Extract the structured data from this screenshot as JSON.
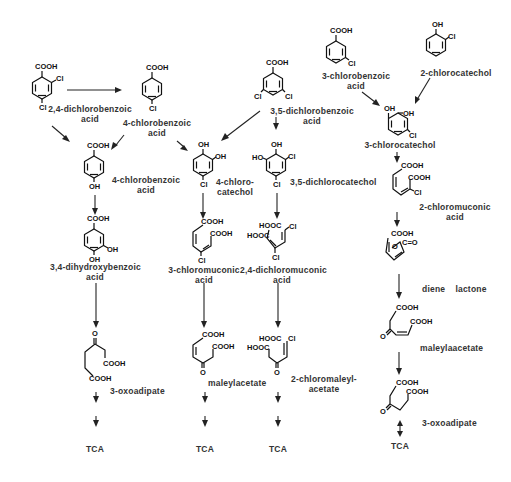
{
  "diagram": {
    "type": "metabolic-pathway",
    "columns": [
      {
        "id": "col1",
        "steps": [
          {
            "compound": "2,4-dichlorobenzoic acid",
            "label_lines": [
              "2,4-dichlorobenzoic",
              "acid"
            ]
          },
          {
            "compound": "4-chlorobenzoic acid",
            "label_lines": [
              "4-chlorobenzoic",
              "acid"
            ]
          },
          {
            "compound": "4-hydroxybenzoate (labelled 4-chlorobenzoic acid)",
            "label_lines": [
              "4-chlorobenzoic",
              "acid"
            ]
          },
          {
            "compound": "3,4-dihydroxybenzoic acid",
            "label_lines": [
              "3,4-dihydroxybenzoic",
              "acid"
            ]
          },
          {
            "compound": "3-oxoadipate",
            "label_lines": [
              "3-oxoadipate"
            ]
          },
          {
            "compound": "TCA",
            "label_lines": [
              "TCA"
            ]
          }
        ]
      },
      {
        "id": "col2",
        "steps": [
          {
            "compound": "4-chlorocatechol",
            "label_lines": [
              "4-chloro-",
              "catechol"
            ]
          },
          {
            "compound": "3-chloromuconic acid",
            "label_lines": [
              "3-chloromuconic",
              "acid"
            ]
          },
          {
            "compound": "maleylacetate",
            "label_lines": [
              "maleylacetate"
            ]
          },
          {
            "compound": "TCA",
            "label_lines": [
              "TCA"
            ]
          }
        ]
      },
      {
        "id": "col3",
        "steps": [
          {
            "compound": "3,5-dichlorobenzoic acid",
            "label_lines": [
              "3,5-dichlorobenzoic",
              "acid"
            ]
          },
          {
            "compound": "3,5-dichlorocatechol",
            "label_lines": [
              "3,5-dichlorocatechol"
            ]
          },
          {
            "compound": "2,4-dichloromuconic acid",
            "label_lines": [
              "2,4-dichloromuconic",
              "acid"
            ]
          },
          {
            "compound": "2-chloromaleylacetate",
            "label_lines": [
              "2-chloromaleyl-",
              "acetate"
            ]
          },
          {
            "compound": "TCA",
            "label_lines": [
              "TCA"
            ]
          }
        ]
      },
      {
        "id": "col4",
        "steps": [
          {
            "compound": "3-chlorobenzoic acid",
            "label_lines": [
              "3-chlorobenzoic",
              "acid"
            ]
          },
          {
            "compound": "2-chlorocatechol",
            "label_lines": [
              "2-chlorocatechol"
            ]
          },
          {
            "compound": "3-chlorocatechol",
            "label_lines": [
              "3-chlorocatechol"
            ]
          },
          {
            "compound": "2-chloromuconic acid",
            "label_lines": [
              "2-chloromuconic",
              "acid"
            ]
          },
          {
            "compound": "diene lactone",
            "label_lines": [
              "diene    lactone"
            ]
          },
          {
            "compound": "maleylaacetate",
            "label_lines": [
              "maleylaacetate"
            ]
          },
          {
            "compound": "3-oxoadipate",
            "label_lines": [
              "3-oxoadipate"
            ]
          },
          {
            "compound": "TCA",
            "label_lines": [
              "TCA"
            ]
          }
        ]
      }
    ],
    "edges": [
      [
        "2,4-dichlorobenzoic acid",
        "4-chlorobenzoic acid"
      ],
      [
        "2,4-dichlorobenzoic acid",
        "4-hydroxybenzoate"
      ],
      [
        "4-chlorobenzoic acid",
        "4-hydroxybenzoate"
      ],
      [
        "4-chlorobenzoic acid",
        "4-chlorocatechol"
      ],
      [
        "3,5-dichlorobenzoic acid",
        "4-chlorocatechol"
      ],
      [
        "3,5-dichlorobenzoic acid",
        "3,5-dichlorocatechol"
      ],
      [
        "3-chlorobenzoic acid",
        "3-chlorocatechol"
      ],
      [
        "2-chlorocatechol",
        "3-chlorocatechol"
      ],
      [
        "4-hydroxybenzoate",
        "3,4-dihydroxybenzoic acid"
      ],
      [
        "3,4-dihydroxybenzoic acid",
        "3-oxoadipate"
      ],
      [
        "3-oxoadipate",
        "TCA"
      ],
      [
        "4-chlorocatechol",
        "3-chloromuconic acid"
      ],
      [
        "3-chloromuconic acid",
        "maleylacetate"
      ],
      [
        "maleylacetate",
        "TCA"
      ],
      [
        "3,5-dichlorocatechol",
        "2,4-dichloromuconic acid"
      ],
      [
        "2,4-dichloromuconic acid",
        "2-chloromaleylacetate"
      ],
      [
        "2-chloromaleylacetate",
        "TCA"
      ],
      [
        "3-chlorocatechol",
        "2-chloromuconic acid"
      ],
      [
        "2-chloromuconic acid",
        "diene lactone"
      ],
      [
        "diene lactone",
        "maleylaacetate"
      ],
      [
        "maleylaacetate",
        "3-oxoadipate"
      ],
      [
        "3-oxoadipate",
        "TCA"
      ]
    ]
  },
  "labels": {
    "dcba24": [
      "2,4-dichlorobenzoic",
      "acid"
    ],
    "cba4_top": [
      "4-chlorobenzoic",
      "acid"
    ],
    "dcba35": [
      "3,5-dichlorobenzoic",
      "acid"
    ],
    "cba3": [
      "3-chlorobenzoic",
      "acid"
    ],
    "cc2": "2-chlorocatechol",
    "cc3": "3-chlorocatechol",
    "cba4_mid": [
      "4-chlorobenzoic",
      "acid"
    ],
    "cc4": [
      "4-chloro-",
      "catechol"
    ],
    "dcc35": "3,5-dichlorocatechol",
    "cma2": [
      "2-chloromuconic",
      "acid"
    ],
    "dhba34": [
      "3,4-dihydroxybenzoic",
      "acid"
    ],
    "cma3": [
      "3-chloromuconic",
      "acid"
    ],
    "dcma24": [
      "2,4-dichloromuconic",
      "acid"
    ],
    "diene": "diene    lactone",
    "oxo1": "3-oxoadipate",
    "maleyl": "maleylacetate",
    "cmaleyl": [
      "2-chloromaleyl-",
      "acetate"
    ],
    "maleyl2": "maleylaacetate",
    "oxo2": "3-oxoadipate",
    "tca": "TCA"
  },
  "chem_text": {
    "cooh": "COOH",
    "hooc": "HOOC",
    "cl": "Cl",
    "oh": "OH",
    "ho": "HO",
    "o": "O",
    "c_eq_o": "C=O"
  },
  "colors": {
    "ink": "#111111",
    "label": "#333333",
    "background": "#ffffff"
  }
}
